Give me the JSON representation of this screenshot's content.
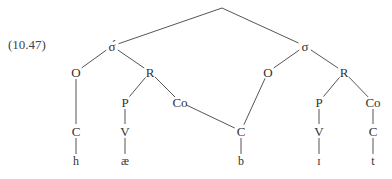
{
  "example_label": "(10.47)",
  "nodes": [
    {
      "id": "root",
      "label": "",
      "x": 222,
      "y": 8
    },
    {
      "id": "syl1",
      "label": "σ́",
      "x": 112,
      "y": 46
    },
    {
      "id": "syl2",
      "label": "σ",
      "x": 305,
      "y": 46
    },
    {
      "id": "O1",
      "label": "O",
      "x": 76,
      "y": 72
    },
    {
      "id": "R1",
      "label": "R",
      "x": 150,
      "y": 72
    },
    {
      "id": "P1",
      "label": "P",
      "x": 125,
      "y": 102
    },
    {
      "id": "Co1",
      "label": "Co",
      "x": 180,
      "y": 102
    },
    {
      "id": "C1",
      "label": "C",
      "x": 76,
      "y": 131
    },
    {
      "id": "V1",
      "label": "V",
      "x": 125,
      "y": 131
    },
    {
      "id": "Cshared",
      "label": "C",
      "x": 241,
      "y": 131
    },
    {
      "id": "O2",
      "label": "O",
      "x": 268,
      "y": 72
    },
    {
      "id": "R2",
      "label": "R",
      "x": 344,
      "y": 72
    },
    {
      "id": "P2",
      "label": "P",
      "x": 319,
      "y": 102
    },
    {
      "id": "Co2",
      "label": "Co",
      "x": 373,
      "y": 102
    },
    {
      "id": "V2",
      "label": "V",
      "x": 319,
      "y": 131
    },
    {
      "id": "C2",
      "label": "C",
      "x": 373,
      "y": 131
    }
  ],
  "segments": [
    {
      "id": "h",
      "label": "h",
      "x": 76,
      "y": 161
    },
    {
      "id": "ae",
      "label": "æ",
      "x": 125,
      "y": 161
    },
    {
      "id": "b",
      "label": "b",
      "x": 241,
      "y": 161
    },
    {
      "id": "I",
      "label": "ɪ",
      "x": 319,
      "y": 161
    },
    {
      "id": "t",
      "label": "t",
      "x": 373,
      "y": 161
    }
  ],
  "edges": [
    [
      "root",
      "syl1"
    ],
    [
      "root",
      "syl2"
    ],
    [
      "syl1",
      "O1"
    ],
    [
      "syl1",
      "R1"
    ],
    [
      "R1",
      "P1"
    ],
    [
      "R1",
      "Co1"
    ],
    [
      "O1",
      "C1"
    ],
    [
      "P1",
      "V1"
    ],
    [
      "Co1",
      "Cshared"
    ],
    [
      "syl2",
      "O2"
    ],
    [
      "syl2",
      "R2"
    ],
    [
      "O2",
      "Cshared"
    ],
    [
      "R2",
      "P2"
    ],
    [
      "R2",
      "Co2"
    ],
    [
      "P2",
      "V2"
    ],
    [
      "Co2",
      "C2"
    ],
    [
      "C1",
      "h"
    ],
    [
      "V1",
      "ae"
    ],
    [
      "Cshared",
      "b"
    ],
    [
      "V2",
      "I"
    ],
    [
      "C2",
      "t"
    ]
  ]
}
